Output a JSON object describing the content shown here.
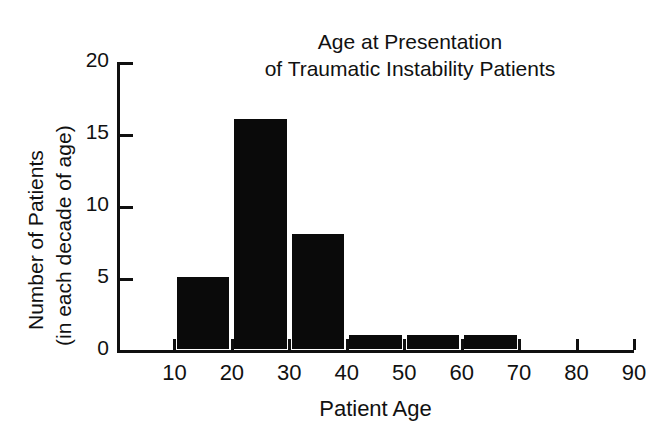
{
  "chart_data": {
    "type": "bar",
    "title": "Age at Presentation of Traumatic Instability Patients",
    "title_lines": [
      "Age at Presentation",
      "of Traumatic Instability Patients"
    ],
    "xlabel": "Patient Age",
    "ylabel": "Number of Patients (in each decade of age)",
    "ylabel_lines": [
      "Number of Patients",
      "(in each decade of age)"
    ],
    "categories": [
      "10-20",
      "20-30",
      "30-40",
      "40-50",
      "50-60",
      "60-70",
      "70-80",
      "80-90"
    ],
    "bin_starts": [
      10,
      20,
      30,
      40,
      50,
      60,
      70,
      80
    ],
    "bin_ends": [
      20,
      30,
      40,
      50,
      60,
      70,
      80,
      90
    ],
    "values": [
      5,
      16,
      8,
      1,
      1,
      1,
      0,
      0
    ],
    "xlim": [
      0,
      90
    ],
    "ylim": [
      0,
      20
    ],
    "xticks": [
      10,
      20,
      30,
      40,
      50,
      60,
      70,
      80,
      90
    ],
    "xtick_labels": [
      "10",
      "20",
      "30",
      "40",
      "50",
      "60",
      "70",
      "80",
      "90"
    ],
    "yticks": [
      0,
      5,
      10,
      15,
      20
    ],
    "ytick_labels": [
      "0",
      "5",
      "10",
      "15",
      "20"
    ],
    "grid": false,
    "legend": null,
    "bar_color": "#0a0a0a",
    "axis_color": "#101010",
    "background": "#ffffff",
    "total_patients": 32
  }
}
